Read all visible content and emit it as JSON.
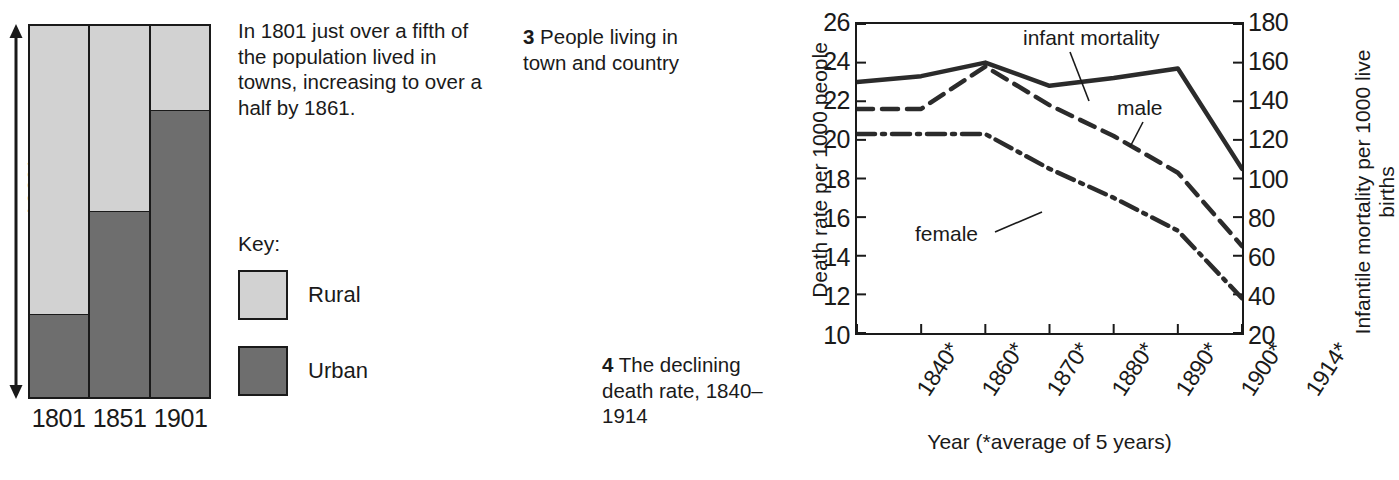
{
  "top_title_partial": "A Changing Britain,  1800–1900",
  "bar_figure": {
    "axis_label": "100%",
    "x_labels": [
      "1801",
      "1851",
      "1901"
    ],
    "key": {
      "title": "Key:",
      "items": [
        {
          "label": "Rural",
          "color": "#d2d2d2"
        },
        {
          "label": "Urban",
          "color": "#6e6e6e"
        }
      ]
    }
  },
  "blurb": "In 1801 just over a fifth of the population lived in towns, increasing to over a half by 1861.",
  "caption_3": {
    "number": "3",
    "text": " People living in town and country"
  },
  "caption_4": {
    "number": "4",
    "text": " The declining death rate, 1840–1914"
  },
  "line_figure": {
    "y_axis_left_title": "Death rate per 1000 people",
    "y_axis_right_title": "Infantile mortality per 1000 live births",
    "x_axis_title": "Year (*average of 5 years)",
    "annotations": [
      {
        "name": "infant-mortality",
        "label": "infant mortality"
      },
      {
        "name": "male",
        "label": "male"
      },
      {
        "name": "female",
        "label": "female"
      }
    ]
  },
  "chart_data": [
    {
      "type": "bar",
      "subtype": "stacked-100-percent",
      "title": "People living in town and country",
      "categories": [
        "1801",
        "1851",
        "1901"
      ],
      "xlabel": "",
      "ylabel": "100%",
      "ylim": [
        0,
        100
      ],
      "grid": false,
      "legend_position": "left-middle",
      "series": [
        {
          "name": "Rural",
          "color": "#d2d2d2",
          "values": [
            78,
            50,
            23
          ]
        },
        {
          "name": "Urban",
          "color": "#6e6e6e",
          "values": [
            22,
            50,
            77
          ]
        }
      ]
    },
    {
      "type": "line",
      "title": "The declining death rate, 1840–1914",
      "x": [
        "1840*",
        "1860*",
        "1870*",
        "1880*",
        "1890*",
        "1900*",
        "1914*"
      ],
      "xlabel": "Year (*average of 5 years)",
      "grid": false,
      "legend_position": "inline-annotations",
      "axes": [
        {
          "name": "left",
          "label": "Death rate per 1000 people",
          "ylim": [
            10,
            26
          ],
          "ticks": [
            10,
            12,
            14,
            16,
            18,
            20,
            22,
            24,
            26
          ]
        },
        {
          "name": "right",
          "label": "Infantile mortality per 1000 live births",
          "ylim": [
            20,
            180
          ],
          "ticks": [
            20,
            40,
            60,
            80,
            100,
            120,
            140,
            160,
            180
          ]
        }
      ],
      "series": [
        {
          "name": "infant mortality",
          "axis": "right",
          "style": "solid",
          "values": [
            150,
            153,
            160,
            148,
            152,
            157,
            105
          ]
        },
        {
          "name": "male",
          "axis": "left",
          "style": "dashed",
          "values": [
            21.6,
            21.6,
            23.8,
            21.8,
            20.2,
            18.3,
            14.5
          ]
        },
        {
          "name": "female",
          "axis": "left",
          "style": "dash-dot",
          "values": [
            20.3,
            20.3,
            20.3,
            18.5,
            17.0,
            15.3,
            11.8
          ]
        }
      ]
    }
  ]
}
